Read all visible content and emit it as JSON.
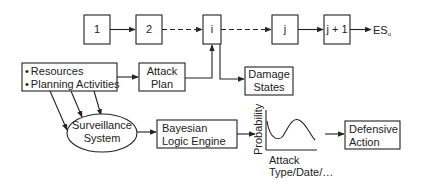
{
  "diagram": {
    "chain": [
      {
        "id": "1",
        "label": "1"
      },
      {
        "id": "2",
        "label": "2"
      },
      {
        "id": "i",
        "label": "i"
      },
      {
        "id": "j",
        "label": "j"
      },
      {
        "id": "j1",
        "label": "j + 1"
      }
    ],
    "end_label": "ES",
    "end_subscript": "u",
    "inputs": {
      "bullet1": "Resources",
      "bullet2": "Planning Activities",
      "bullet_glyph": "•"
    },
    "attack_plan": {
      "line1": "Attack",
      "line2": "Plan"
    },
    "damage_states": {
      "line1": "Damage",
      "line2": "States"
    },
    "surveillance": {
      "line1": "Surveillance",
      "line2": "System"
    },
    "bayesian": {
      "line1": "Bayesian",
      "line2": "Logic Engine"
    },
    "plot": {
      "ylabel": "Probability",
      "xlabel1": "Attack",
      "xlabel2": "Type/Date/…"
    },
    "defensive": {
      "line1": "Defensive",
      "line2": "Action"
    }
  }
}
